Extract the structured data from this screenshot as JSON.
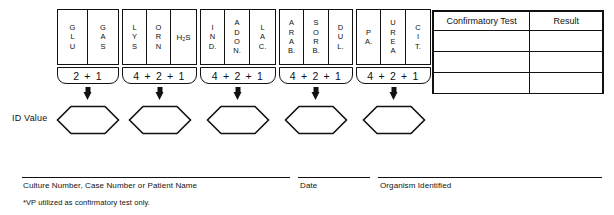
{
  "strip": {
    "groups": [
      {
        "id": "group-1",
        "cells": [
          {
            "name": "glu",
            "label": "G\nL\nU",
            "width": 30
          },
          {
            "name": "gas",
            "label": "G\nA\nS",
            "width": 30
          }
        ],
        "sum": "2 + 1",
        "sum_width": 62
      },
      {
        "id": "group-2",
        "cells": [
          {
            "name": "lys",
            "label": "L\nY\nS",
            "width": 24
          },
          {
            "name": "orn",
            "label": "O\nR\nN",
            "width": 24
          },
          {
            "name": "h2s",
            "label": "H₂S",
            "width": 25,
            "inline": true
          }
        ],
        "sum": "4 + 2 + 1",
        "sum_width": 75
      },
      {
        "id": "group-3",
        "cells": [
          {
            "name": "ind",
            "label": "I\nN\nD.",
            "width": 24
          },
          {
            "name": "adon",
            "label": "A\nD\nO\nN.",
            "width": 25
          },
          {
            "name": "lac",
            "label": "L\nA\nC.",
            "width": 25
          }
        ],
        "sum": "4 + 2 + 1",
        "sum_width": 76
      },
      {
        "id": "group-4",
        "cells": [
          {
            "name": "arab",
            "label": "A\nR\nA\nB.",
            "width": 24
          },
          {
            "name": "sorb",
            "label": "S\nO\nR\nB.",
            "width": 25
          },
          {
            "name": "dul",
            "label": "D\nU\nL.",
            "width": 23
          }
        ],
        "sum": "4 + 2 + 1",
        "sum_width": 74
      },
      {
        "id": "group-5",
        "cells": [
          {
            "name": "pa",
            "label": "P\nA.",
            "width": 24
          },
          {
            "name": "urea",
            "label": "U\nR\nE\nA",
            "width": 25
          },
          {
            "name": "cit",
            "label": "C\nI\nT.",
            "width": 24
          }
        ],
        "sum": "4 + 2 + 1",
        "sum_width": 75
      }
    ]
  },
  "id_value": {
    "label": "ID Value",
    "hexagons": [
      "",
      "",
      "",
      "",
      ""
    ]
  },
  "confirmatory_table": {
    "headers": [
      "Confirmatory Test",
      "Result"
    ],
    "rows": [
      [
        "",
        ""
      ],
      [
        "",
        ""
      ],
      [
        "",
        ""
      ]
    ]
  },
  "footer": {
    "culture_caption": "Culture Number, Case Number or Patient Name",
    "date_caption": "Date",
    "organism_caption": "Organism Identified",
    "footnote": "*VP utilized as confirmatory test only."
  }
}
